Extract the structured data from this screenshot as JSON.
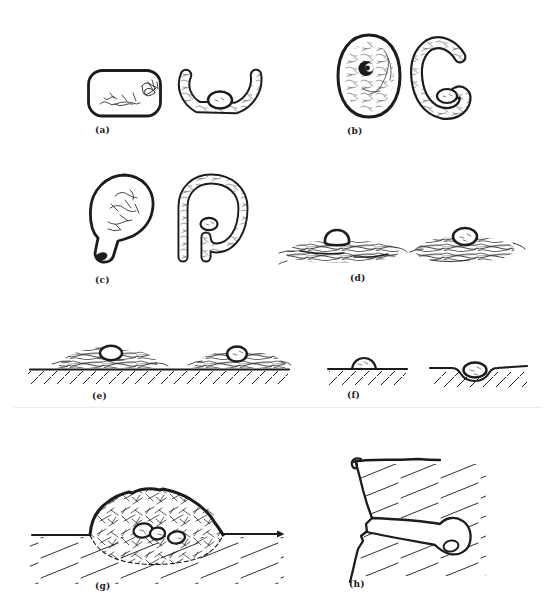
{
  "figure": {
    "colors": {
      "ink": "#1c1c1c",
      "background": "#ffffff",
      "fold_line": "#ebebeb",
      "egg_fill": "#ffffff"
    },
    "panels": {
      "a": {
        "label": "(a)",
        "alt": "two open cup nests in cross-section, right one holding an egg"
      },
      "b": {
        "label": "(b)",
        "alt": "enclosed spherical nest with dark side entrance hole, and cut-away view with egg inside"
      },
      "c": {
        "label": "(c)",
        "alt": "pendant nest with bottom entrance tube, and cut-away view with egg in chamber"
      },
      "d": {
        "label": "(d)",
        "alt": "two stick platform nests each with a single egg on top"
      },
      "e": {
        "label": "(e)",
        "alt": "two stick platform nests on the ground with eggs, hatched ground line"
      },
      "f": {
        "label": "(f)",
        "alt": "scrape nests: egg on bare ground and egg in a shallow depression"
      },
      "g": {
        "label": "(g)",
        "alt": "vegetation mound nest with three eggs buried inside, hatched ground"
      },
      "h": {
        "label": "(h)",
        "alt": "burrow nest in a bank: tunnel leading to a round chamber with one egg"
      }
    }
  }
}
